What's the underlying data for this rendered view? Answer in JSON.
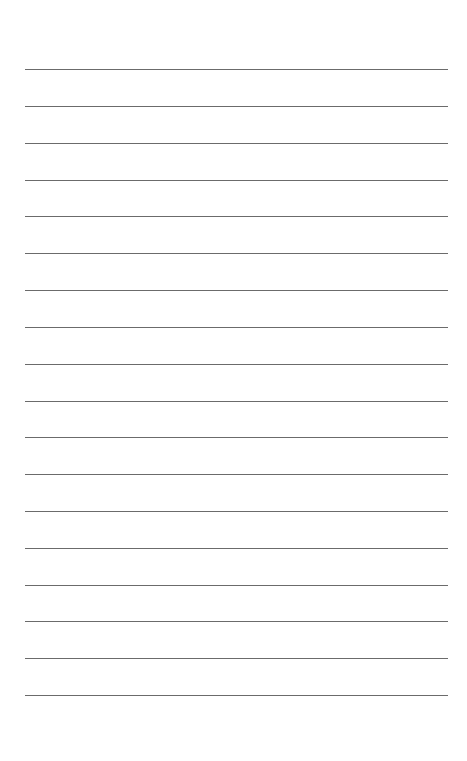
{
  "page": {
    "type": "lined-paper",
    "background_color": "#ffffff",
    "rule_color": "#6b6b6b",
    "rule_count": 18,
    "rules_y": [
      69,
      106,
      143,
      180,
      216,
      253,
      290,
      327,
      364,
      401,
      437,
      474,
      511,
      548,
      585,
      621,
      658,
      695
    ],
    "rule_x_start": 25,
    "rule_x_end": 448,
    "text": []
  }
}
